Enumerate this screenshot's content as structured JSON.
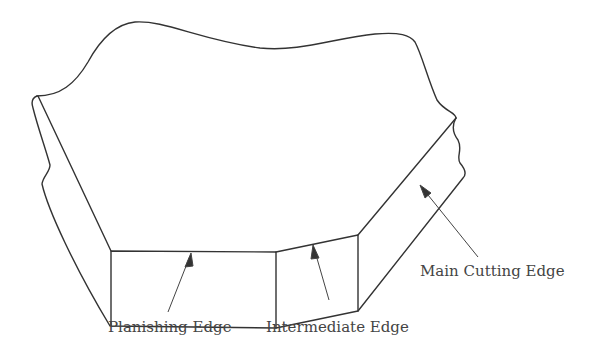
{
  "figure": {
    "type": "cutting tool insert edges diagram",
    "labels": {
      "main_cutting_edge": "Main Cutting Edge",
      "planishing_edge": "Planishing Edge",
      "intermediate_edge": "Intermediate Edge"
    },
    "colors": {
      "stroke": "#333333",
      "text": "#444444",
      "background": "#ffffff"
    }
  }
}
